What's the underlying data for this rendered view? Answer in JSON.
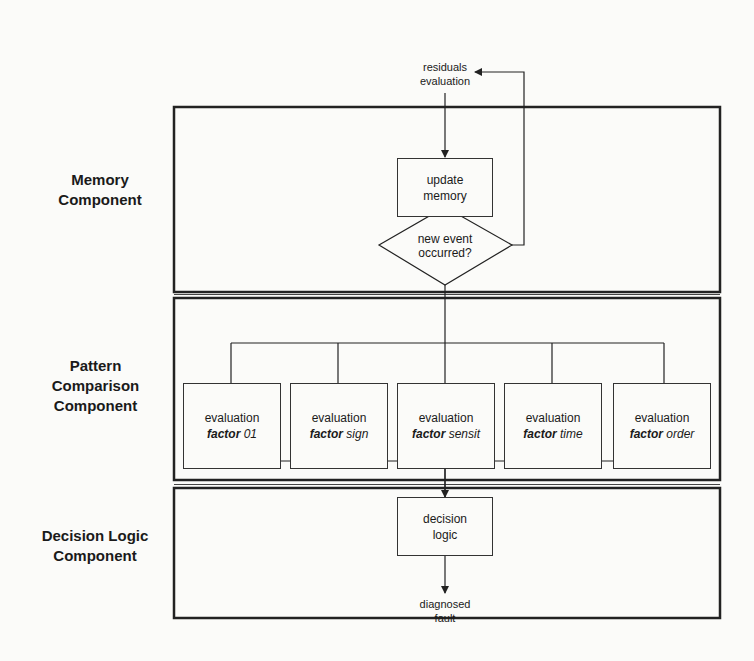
{
  "diagram": {
    "input": {
      "line1": "residuals",
      "line2": "evaluation"
    },
    "output": {
      "line1": "diagnosed",
      "line2": "fault"
    },
    "components": [
      {
        "id": "memory",
        "line1": "Memory",
        "line2": "Component"
      },
      {
        "id": "pattern",
        "line1": "Pattern",
        "line2": "Comparison",
        "line3": "Component"
      },
      {
        "id": "decision",
        "line1": "Decision Logic",
        "line2": "Component"
      }
    ],
    "memory": {
      "update": {
        "line1": "update",
        "line2": "memory"
      },
      "decision": {
        "line1": "new event",
        "line2": "occurred?"
      }
    },
    "factors": [
      {
        "line1": "evaluation",
        "bold": "factor",
        "suffix": "01"
      },
      {
        "line1": "evaluation",
        "bold": "factor",
        "suffix": "sign"
      },
      {
        "line1": "evaluation",
        "bold": "factor",
        "suffix": "sensit"
      },
      {
        "line1": "evaluation",
        "bold": "factor",
        "suffix": "time"
      },
      {
        "line1": "evaluation",
        "bold": "factor",
        "suffix": "order"
      }
    ],
    "decision_logic": {
      "line1": "decision",
      "line2": "logic"
    }
  }
}
